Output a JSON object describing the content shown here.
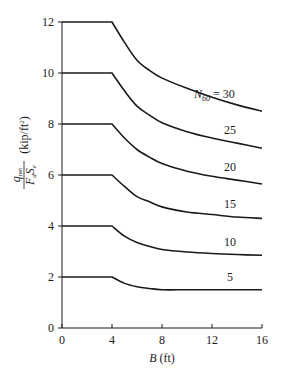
{
  "chart_data": {
    "type": "line",
    "title": "",
    "xlabel": "B (ft)",
    "xlabel_var": "B",
    "xlabel_unit": "(ft)",
    "ylabel": "q_net / (F_d S_e) (kip/ft²)",
    "ylabel_num": "q",
    "ylabel_num_sub": "net",
    "ylabel_den_F": "F",
    "ylabel_den_F_sub": "d",
    "ylabel_den_S": "S",
    "ylabel_den_S_sub": "e",
    "ylabel_unit": "(kip/ft",
    "ylabel_unit_sup": "2",
    "ylabel_unit_close": ")",
    "xlim": [
      0,
      16
    ],
    "ylim": [
      0,
      12
    ],
    "xticks": [
      0,
      4,
      8,
      12,
      16
    ],
    "yticks": [
      0,
      2,
      4,
      6,
      8,
      10,
      12
    ],
    "grid": false,
    "legend": "inline labels at right end of curves",
    "x": [
      0,
      4,
      5,
      6,
      7,
      8,
      10,
      12,
      14,
      16
    ],
    "series": [
      {
        "name": "N60 = 30",
        "label_prefix": "N",
        "label_sub": "60",
        "label_suffix": " = 30",
        "values": [
          12,
          12,
          11.2,
          10.5,
          10.1,
          9.8,
          9.4,
          9.05,
          8.75,
          8.5
        ]
      },
      {
        "name": "25",
        "label": "25",
        "values": [
          10,
          10,
          9.3,
          8.7,
          8.35,
          8.05,
          7.7,
          7.45,
          7.25,
          7.05
        ]
      },
      {
        "name": "20",
        "label": "20",
        "values": [
          8,
          8,
          7.45,
          7.0,
          6.7,
          6.45,
          6.15,
          5.95,
          5.8,
          5.65
        ]
      },
      {
        "name": "15",
        "label": "15",
        "values": [
          6,
          6,
          5.55,
          5.15,
          4.95,
          4.75,
          4.55,
          4.45,
          4.35,
          4.3
        ]
      },
      {
        "name": "10",
        "label": "10",
        "values": [
          4,
          4,
          3.6,
          3.35,
          3.2,
          3.08,
          2.98,
          2.92,
          2.88,
          2.85
        ]
      },
      {
        "name": "5",
        "label": "5",
        "values": [
          2,
          2,
          1.75,
          1.62,
          1.55,
          1.5,
          1.5,
          1.5,
          1.5,
          1.5
        ]
      }
    ]
  },
  "colors": {
    "line": "#1a1a1a",
    "background": "#ffffff"
  }
}
